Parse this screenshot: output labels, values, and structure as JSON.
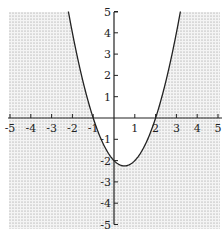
{
  "chart_data": {
    "type": "line",
    "title": "",
    "xlabel": "",
    "ylabel": "",
    "xlim": [
      -5,
      5
    ],
    "ylim": [
      -5,
      5
    ],
    "grid": false,
    "series": [
      {
        "name": "y = x^2 - x - 2",
        "equation": "y = x^2 - x - 2",
        "x": [
          -2.0,
          -1.5,
          -1,
          -0.5,
          0,
          0.5,
          1,
          1.5,
          2,
          2.5,
          3
        ],
        "y": [
          4,
          1.75,
          0,
          -1.25,
          -2,
          -2.25,
          -2,
          -1.25,
          0,
          1.75,
          4
        ]
      }
    ],
    "shaded_region": "y < x^2 - x - 2 (outside the parabola, dotted)",
    "x_ticks": [
      "-5",
      "-4",
      "-3",
      "-2",
      "-1",
      "1",
      "2",
      "3",
      "4",
      "5"
    ],
    "y_ticks": [
      "5",
      "4",
      "3",
      "2",
      "1",
      "-1",
      "-2",
      "-3",
      "-4",
      "-5"
    ]
  }
}
